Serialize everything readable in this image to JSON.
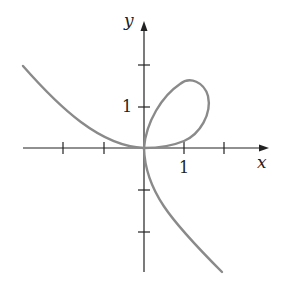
{
  "diagram": {
    "type": "parametric-curve-plot",
    "axes": {
      "x_label": "x",
      "y_label": "y",
      "x_tick_label": "1",
      "y_tick_label": "1",
      "x_ticks": [
        -2,
        -1,
        1,
        2
      ],
      "y_ticks": [
        -2,
        -1,
        1,
        2
      ]
    },
    "curve": {
      "description": "Curve with a loop in the first quadrant through the origin, cusp-like tangency at origin, branch to upper-left and branch to lower-right",
      "color": "#8a8a8a"
    },
    "colors": {
      "axis": "#222222",
      "curve": "#8a8a8a",
      "background": "#ffffff"
    }
  }
}
